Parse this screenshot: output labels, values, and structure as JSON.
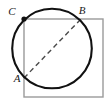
{
  "figure": {
    "background_color": "#ffffff",
    "square": {
      "name": "square",
      "stroke_color": "#9a9a9a",
      "stroke_width": 1.4,
      "fill": "none",
      "x": 24,
      "y": 19,
      "width": 79,
      "height": 78
    },
    "circle": {
      "name": "circle",
      "stroke_color": "#111111",
      "stroke_width": 2.1,
      "fill": "none",
      "cx": 52,
      "cy": 48.5,
      "r": 39.8
    },
    "diagonal": {
      "name": "dashed-diameter-AB",
      "stroke_color": "#4a4a4a",
      "stroke_width": 1.4,
      "dash_pattern": "5,3.5",
      "x1": 24,
      "y1": 78,
      "x2": 80.5,
      "y2": 19.5
    },
    "points": [
      {
        "id": "A",
        "label": "A",
        "x": 24,
        "y": 78,
        "label_x": 17,
        "label_y": 82,
        "marker": "none"
      },
      {
        "id": "B",
        "label": "B",
        "x": 80.5,
        "y": 19.5,
        "label_x": 82,
        "label_y": 14,
        "marker": "none"
      },
      {
        "id": "C",
        "label": "C",
        "x": 24,
        "y": 19,
        "label_x": 12,
        "label_y": 15,
        "marker": "filled-dot",
        "marker_radius": 2.6,
        "marker_color": "#111111"
      }
    ]
  }
}
